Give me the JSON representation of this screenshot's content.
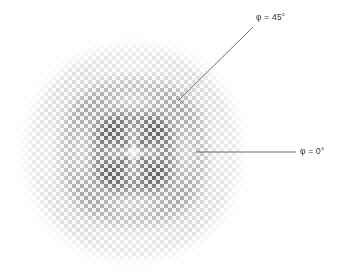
{
  "figure": {
    "title": "",
    "width": 348,
    "height": 272,
    "background_color": "#ffffff"
  },
  "annotations": [
    {
      "id": "phi45",
      "label": "φ = 45°",
      "angle_deg": 45,
      "symbol": "φ",
      "value": "45°",
      "label_x": 256,
      "label_y": 12,
      "line": {
        "x1": 253,
        "y1": 27,
        "x2": 178,
        "y2": 101
      },
      "line_color": "#5a5a5a"
    },
    {
      "id": "phi0",
      "label": "φ = 0°",
      "angle_deg": 0,
      "symbol": "φ",
      "value": "0°",
      "label_x": 300,
      "label_y": 146,
      "line": {
        "x1": 296,
        "y1": 152,
        "x2": 196,
        "y2": 152
      },
      "line_color": "#5a5a5a"
    }
  ],
  "chart_data": {
    "type": "heatmap",
    "title": "",
    "xlabel": "",
    "ylabel": "",
    "colormap": "grayscale",
    "grid": false,
    "legend": null,
    "center": {
      "x": 133,
      "y": 152
    },
    "radius": 128,
    "cell_size": 4,
    "checker_phase": 0,
    "lobes": 4,
    "lobe_orientation_deg": 45,
    "intensity_min": 0.0,
    "intensity_max": 1.0,
    "ring_period": 34,
    "envelope_falloff": 1.35,
    "dark_cell_level": 0.18,
    "light_cell_level": 0.88,
    "annotated_angles_deg": [
      0,
      45
    ]
  }
}
